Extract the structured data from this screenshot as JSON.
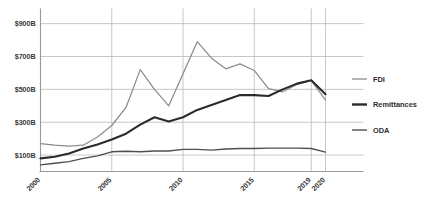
{
  "chart_data": {
    "type": "line",
    "title": "",
    "subtitle": "",
    "xlabel": "",
    "ylabel": "",
    "xlim": [
      2000,
      2020
    ],
    "ylim": [
      0,
      980
    ],
    "grid": true,
    "grid_axis": "both",
    "legend_position": "right",
    "y_ticks": [
      100,
      300,
      500,
      700,
      900
    ],
    "y_tick_labels": [
      "$100B",
      "$300B",
      "$500B",
      "$700B",
      "$900B"
    ],
    "x_ticks": [
      2000,
      2005,
      2010,
      2015,
      2019,
      2020
    ],
    "x_tick_labels": [
      "2000",
      "2005",
      "2010",
      "2015",
      "2019",
      "2020"
    ],
    "x": [
      2000,
      2001,
      2002,
      2003,
      2004,
      2005,
      2006,
      2007,
      2008,
      2009,
      2010,
      2011,
      2012,
      2013,
      2014,
      2015,
      2016,
      2017,
      2018,
      2019,
      2020
    ],
    "series": [
      {
        "name": "FDI",
        "color": "#8c8c8c",
        "width": 1.25,
        "values": [
          170,
          160,
          155,
          160,
          210,
          280,
          390,
          620,
          500,
          400,
          595,
          790,
          690,
          625,
          655,
          615,
          505,
          485,
          530,
          555,
          435
        ]
      },
      {
        "name": "Remittances",
        "color": "#2b2b2b",
        "width": 2.1,
        "values": [
          80,
          90,
          110,
          140,
          165,
          195,
          230,
          285,
          330,
          305,
          330,
          375,
          405,
          435,
          465,
          465,
          460,
          500,
          535,
          555,
          470
        ]
      },
      {
        "name": "ODA",
        "color": "#4f4f4f",
        "width": 1.35,
        "values": [
          40,
          50,
          60,
          80,
          95,
          120,
          123,
          120,
          125,
          125,
          135,
          135,
          130,
          137,
          140,
          140,
          142,
          142,
          142,
          140,
          118
        ]
      }
    ]
  },
  "legend": {
    "items": [
      {
        "label": "FDI",
        "color": "#8c8c8c",
        "width": 1.3
      },
      {
        "label": "Remittances",
        "color": "#2b2b2b",
        "width": 2.4
      },
      {
        "label": "ODA",
        "color": "#4f4f4f",
        "width": 1.4
      }
    ]
  },
  "colors": {
    "background": "#ffffff",
    "grid": "#b9b9b9",
    "axis": "#9a9a9a",
    "text": "#3a3a3a"
  }
}
